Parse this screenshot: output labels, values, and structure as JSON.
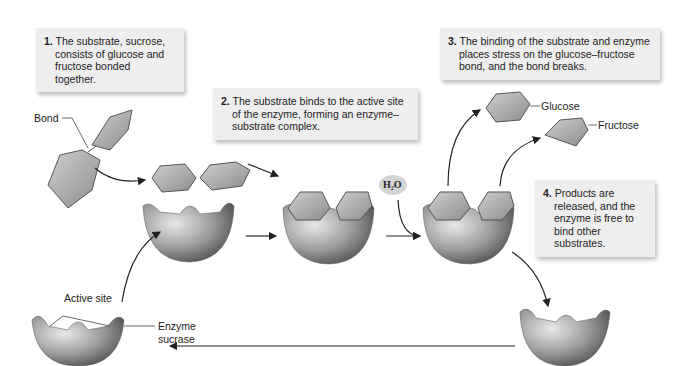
{
  "steps": [
    {
      "num": "1.",
      "text": "The substrate, sucrose, consists of glucose and fructose bonded together."
    },
    {
      "num": "2.",
      "text": "The substrate binds to the active site of the enzyme, forming an enzyme–substrate complex."
    },
    {
      "num": "3.",
      "text": "The binding of the substrate and enzyme places stress on the glucose–fructose bond, and the bond breaks."
    },
    {
      "num": "4.",
      "text": "Products are released, and the enzyme is free to bind other substrates."
    }
  ],
  "labels": {
    "bond": "Bond",
    "glucose": "Glucose",
    "fructose": "Fructose",
    "water": "H₂O",
    "active_site": "Active site",
    "enzyme_line1": "Enzyme",
    "enzyme_line2": "sucrase"
  },
  "colors": {
    "box_bg": "#eeeeee",
    "sugar": "#a8a8a8",
    "enzyme": "#9a9a9a",
    "arrow": "#222222"
  }
}
